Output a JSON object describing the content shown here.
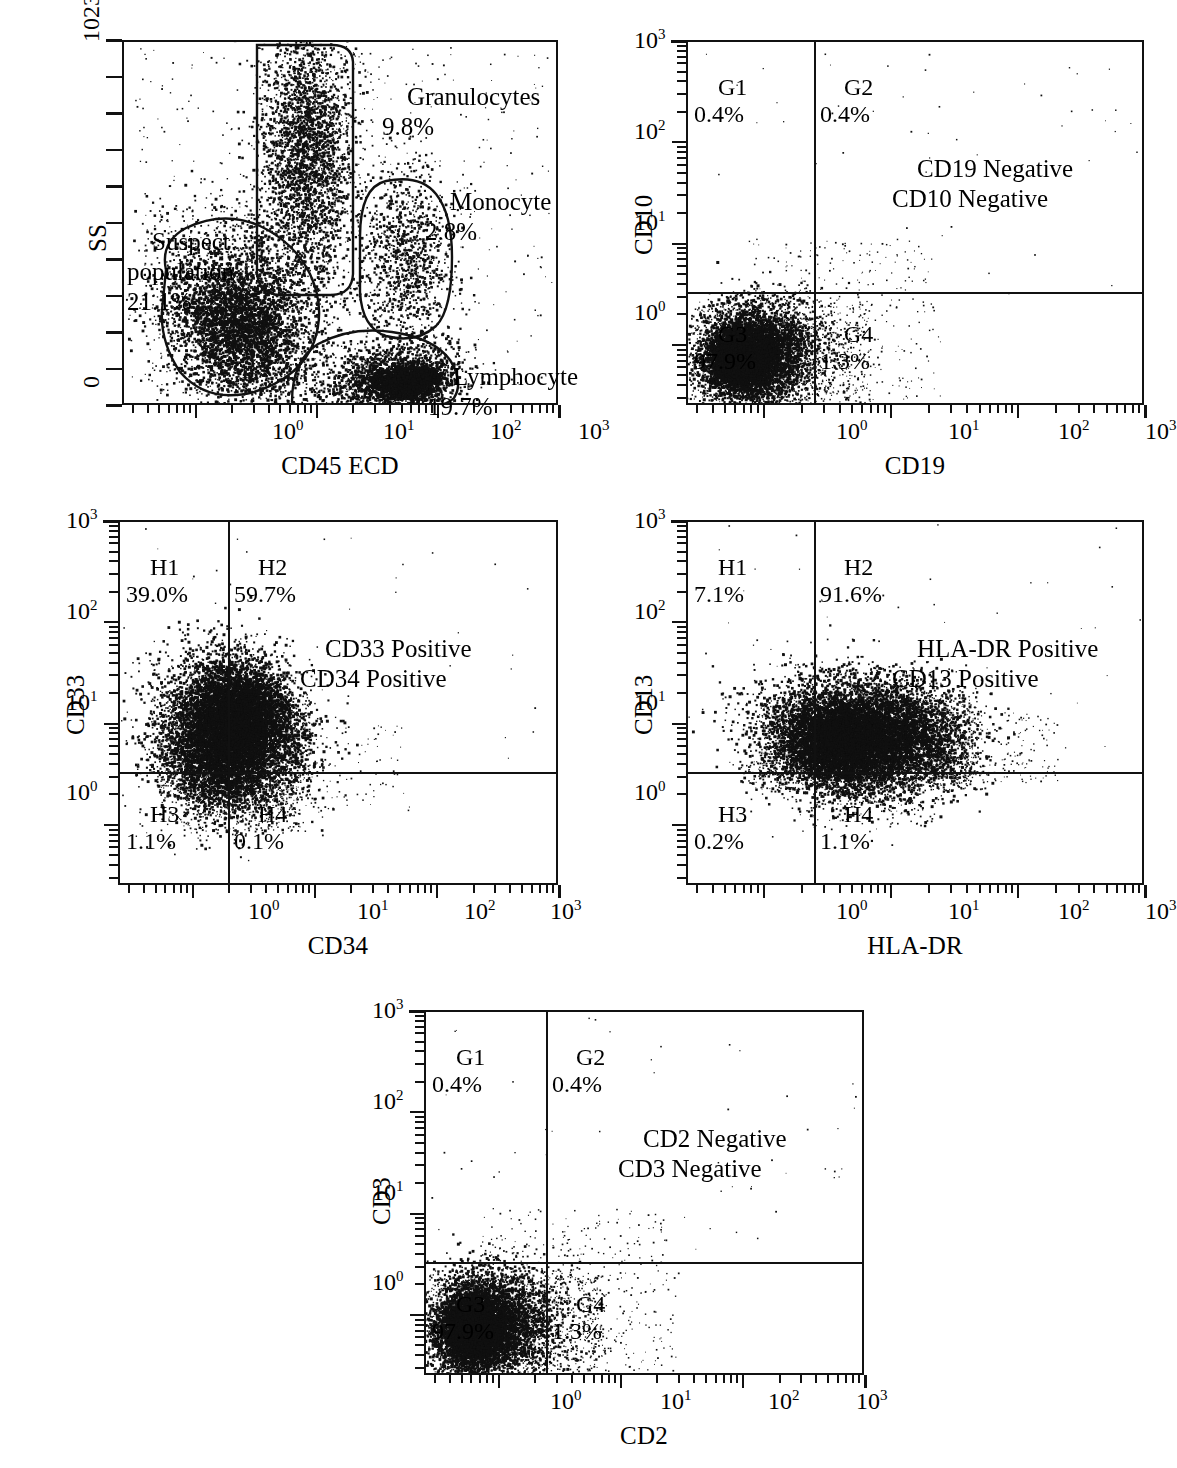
{
  "figure": {
    "kind": "flow-cytometry-dot-plots",
    "panel_count": 5
  },
  "chart_data": [
    {
      "id": "panel-ss-cd45",
      "type": "scatter",
      "title": "",
      "xlabel": "CD45 ECD",
      "ylabel": "SS",
      "x_scale": "log",
      "y_scale": "linear",
      "xlim": [
        0.25,
        1000
      ],
      "ylim": [
        0,
        1023
      ],
      "xticklabels": [
        "10^0",
        "10^1",
        "10^2",
        "10^3"
      ],
      "yticklabels": [
        "0",
        "1023"
      ],
      "grid": false,
      "legend": "none",
      "gates": [
        {
          "name": "Granulocytes",
          "percent": "9.8%",
          "label": "Granulocytes\n9.8%"
        },
        {
          "name": "Monocyte",
          "percent": "2.8%",
          "label": "Monocyte\n2.8%"
        },
        {
          "name": "Suspect population",
          "percent": "21.1%",
          "label": "Suspect\npopulation\n21.1%"
        },
        {
          "name": "Lymphocyte",
          "percent": "19.7%",
          "label": "Lymphocyte\n19.7%"
        }
      ]
    },
    {
      "id": "panel-cd10-cd19",
      "type": "scatter",
      "title": "",
      "xlabel": "CD19",
      "ylabel": "CD10",
      "x_scale": "log",
      "y_scale": "log",
      "xlim": [
        0.25,
        1000
      ],
      "ylim": [
        0.25,
        1000
      ],
      "xticklabels": [
        "10^0",
        "10^1",
        "10^2",
        "10^3"
      ],
      "yticklabels": [
        "10^0",
        "10^1",
        "10^2",
        "10^3"
      ],
      "grid": false,
      "legend": "none",
      "quadrants": [
        {
          "name": "G1",
          "percent": "0.4%",
          "position": "upper-left"
        },
        {
          "name": "G2",
          "percent": "0.4%",
          "position": "upper-right"
        },
        {
          "name": "G3",
          "percent": "97.9%",
          "position": "lower-left"
        },
        {
          "name": "G4",
          "percent": "1.3%",
          "position": "lower-right"
        }
      ],
      "annotation": "CD19 Negative\nCD10 Negative"
    },
    {
      "id": "panel-cd33-cd34",
      "type": "scatter",
      "title": "",
      "xlabel": "CD34",
      "ylabel": "CD33",
      "x_scale": "log",
      "y_scale": "log",
      "xlim": [
        0.25,
        1000
      ],
      "ylim": [
        0.25,
        1000
      ],
      "xticklabels": [
        "10^0",
        "10^1",
        "10^2",
        "10^3"
      ],
      "yticklabels": [
        "10^0",
        "10^1",
        "10^2",
        "10^3"
      ],
      "grid": false,
      "legend": "none",
      "quadrants": [
        {
          "name": "H1",
          "percent": "39.0%",
          "position": "upper-left"
        },
        {
          "name": "H2",
          "percent": "59.7%",
          "position": "upper-right"
        },
        {
          "name": "H3",
          "percent": "1.1%",
          "position": "lower-left"
        },
        {
          "name": "H4",
          "percent": "0.1%",
          "position": "lower-right"
        }
      ],
      "annotation": "CD33 Positive\nCD34 Positive"
    },
    {
      "id": "panel-cd13-hladr",
      "type": "scatter",
      "title": "",
      "xlabel": "HLA-DR",
      "ylabel": "CD13",
      "x_scale": "log",
      "y_scale": "log",
      "xlim": [
        0.25,
        1000
      ],
      "ylim": [
        0.25,
        1000
      ],
      "xticklabels": [
        "10^0",
        "10^1",
        "10^2",
        "10^3"
      ],
      "yticklabels": [
        "10^0",
        "10^1",
        "10^2",
        "10^3"
      ],
      "grid": false,
      "legend": "none",
      "quadrants": [
        {
          "name": "H1",
          "percent": "7.1%",
          "position": "upper-left"
        },
        {
          "name": "H2",
          "percent": "91.6%",
          "position": "upper-right"
        },
        {
          "name": "H3",
          "percent": "0.2%",
          "position": "lower-left"
        },
        {
          "name": "H4",
          "percent": "1.1%",
          "position": "lower-right"
        }
      ],
      "annotation": "HLA-DR Positive\nCD13 Positive"
    },
    {
      "id": "panel-cd3-cd2",
      "type": "scatter",
      "title": "",
      "xlabel": "CD2",
      "ylabel": "CD3",
      "x_scale": "log",
      "y_scale": "log",
      "xlim": [
        0.25,
        1000
      ],
      "ylim": [
        0.25,
        1000
      ],
      "xticklabels": [
        "10^0",
        "10^1",
        "10^2",
        "10^3"
      ],
      "yticklabels": [
        "10^0",
        "10^1",
        "10^2",
        "10^3"
      ],
      "grid": false,
      "legend": "none",
      "quadrants": [
        {
          "name": "G1",
          "percent": "0.4%",
          "position": "upper-left"
        },
        {
          "name": "G2",
          "percent": "0.4%",
          "position": "upper-right"
        },
        {
          "name": "G3",
          "percent": "97.9%",
          "position": "lower-left"
        },
        {
          "name": "G4",
          "percent": "1.3%",
          "position": "lower-right"
        }
      ],
      "annotation": "CD2 Negative\nCD3 Negative"
    }
  ],
  "panels": {
    "p1": {
      "xlabel": "CD45 ECD",
      "ylabel": "SS",
      "ytop": "1023",
      "ybottom": "0",
      "xt0": "10",
      "xt0sup": "0",
      "xt1": "10",
      "xt1sup": "1",
      "xt2": "10",
      "xt2sup": "2",
      "xt3": "10",
      "xt3sup": "3",
      "gate_gran": "Granulocytes\n9.8%",
      "gate_mono": "Monocyte\n2.8%",
      "gate_suspect": "Suspect\npopulation\n21.1%",
      "gate_lymph": "Lymphocyte\n19.7%"
    },
    "p2": {
      "xlabel": "CD19",
      "ylabel": "CD10",
      "q1": "G1\n0.4%",
      "q2": "G2\n0.4%",
      "q3": "G3\n97.9%",
      "q4": "G4\n1.3%",
      "annotation": "CD19 Negative\nCD10 Negative"
    },
    "p3": {
      "xlabel": "CD34",
      "ylabel": "CD33",
      "q1": "H1\n39.0%",
      "q2": "H2\n59.7%",
      "q3": "H3\n1.1%",
      "q4": "H4\n0.1%",
      "annotation": "CD33 Positive\nCD34 Positive"
    },
    "p4": {
      "xlabel": "HLA-DR",
      "ylabel": "CD13",
      "q1": "H1\n7.1%",
      "q2": "H2\n91.6%",
      "q3": "H3\n0.2%",
      "q4": "H4\n1.1%",
      "annotation": "HLA-DR Positive\nCD13 Positive"
    },
    "p5": {
      "xlabel": "CD2",
      "ylabel": "CD3",
      "q1": "G1\n0.4%",
      "q2": "G2\n0.4%",
      "q3": "G3\n97.9%",
      "q4": "G4\n1.3%",
      "annotation": "CD2 Negative\nCD3 Negative"
    }
  },
  "colors": {
    "ink": "#111111",
    "background": "#ffffff",
    "dot": "#101010"
  }
}
